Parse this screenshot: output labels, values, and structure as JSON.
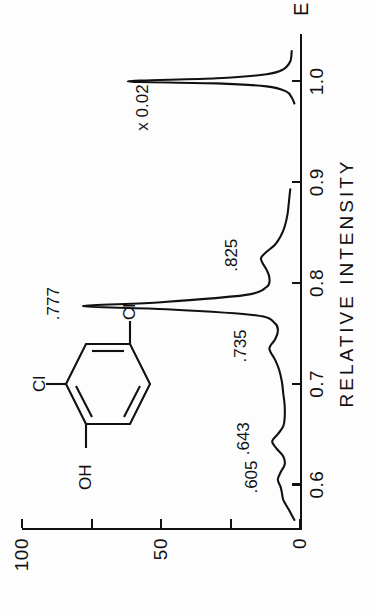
{
  "figure": {
    "compound_name": "2,4-dichlorophenol",
    "scale_annotation": "x 0.02"
  },
  "molecule": {
    "label_oh": "OH",
    "label_cl_ortho": "Cl",
    "label_cl_para": "Cl"
  },
  "chart_data": {
    "type": "line",
    "title": "",
    "subtitle": "",
    "xlabel": "E",
    "ylabel": "RELATIVE  INTENSITY",
    "xlim": [
      0.555,
      1.045
    ],
    "ylim": [
      0,
      100
    ],
    "xticks": [
      0.6,
      0.7,
      0.8,
      0.9,
      1.0
    ],
    "xticklabels": [
      "0.6",
      "0.7",
      "0.8",
      "0.9",
      "1.0"
    ],
    "yticks": [
      0,
      25,
      50,
      75,
      100
    ],
    "yticklabels": [
      "0",
      "",
      "50",
      "",
      "100"
    ],
    "grid": false,
    "legend": null,
    "orientation": "rotated-90-ccw",
    "annotations": [
      {
        "text": "x 0.02",
        "x": 0.965,
        "y": 52
      },
      {
        "text": ".777",
        "x": 0.777,
        "y": 84
      },
      {
        "text": ".825",
        "x": 0.825,
        "y": 20
      },
      {
        "text": ".735",
        "x": 0.735,
        "y": 17
      },
      {
        "text": ".643",
        "x": 0.643,
        "y": 16
      },
      {
        "text": ".605",
        "x": 0.605,
        "y": 13
      }
    ],
    "peaks": [
      {
        "label": "",
        "x": 1.0,
        "height": 62,
        "scaled_by": 0.02
      },
      {
        "label": ".825",
        "x": 0.825,
        "height": 14
      },
      {
        "label": ".777",
        "x": 0.777,
        "height": 78
      },
      {
        "label": ".735",
        "x": 0.735,
        "height": 11
      },
      {
        "label": ".643",
        "x": 0.643,
        "height": 10
      },
      {
        "label": ".605",
        "x": 0.605,
        "height": 8
      }
    ],
    "series": [
      {
        "name": "spectrum",
        "x": [
          0.565,
          0.575,
          0.585,
          0.592,
          0.598,
          0.605,
          0.612,
          0.62,
          0.628,
          0.636,
          0.643,
          0.65,
          0.658,
          0.667,
          0.678,
          0.69,
          0.702,
          0.714,
          0.724,
          0.735,
          0.744,
          0.752,
          0.76,
          0.768,
          0.774,
          0.777,
          0.781,
          0.788,
          0.796,
          0.805,
          0.813,
          0.82,
          0.825,
          0.831,
          0.838,
          0.846,
          0.856,
          0.868,
          0.88,
          0.893
        ],
        "y": [
          2,
          4,
          6,
          6.5,
          7,
          8,
          7,
          5.5,
          6,
          8.5,
          10,
          8,
          6,
          5.5,
          5.5,
          6,
          6.5,
          7.5,
          9,
          11,
          9,
          8,
          9,
          16,
          48,
          78,
          50,
          20,
          12,
          11,
          12,
          13.5,
          14,
          12,
          9,
          7,
          5.5,
          4.5,
          4,
          3.5
        ]
      },
      {
        "name": "spectrum-molecular-ion",
        "note": "vertical scale x 0.02",
        "x": [
          0.978,
          0.984,
          0.99,
          0.995,
          0.998,
          1.0,
          1.003,
          1.007,
          1.012,
          1.02,
          1.03
        ],
        "y": [
          2,
          3,
          5,
          12,
          30,
          62,
          30,
          12,
          6,
          3.5,
          3
        ]
      }
    ]
  }
}
